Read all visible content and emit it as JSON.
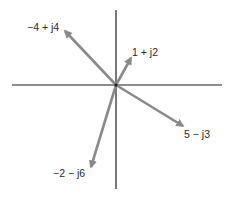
{
  "diagram": {
    "colors": {
      "axis": "#1e1e1e",
      "arrow": "#8a8a8a",
      "text": "#2a2a2a",
      "background": "#ffffff"
    },
    "origin": {
      "x": 116,
      "y": 85
    },
    "axes": {
      "horizontal": {
        "x1": 12,
        "y1": 85,
        "x2": 222,
        "y2": 85
      },
      "vertical": {
        "x1": 116,
        "y1": 10,
        "x2": 116,
        "y2": 189
      }
    },
    "phasors": [
      {
        "label": "−4 + j4",
        "real": -4,
        "imag": 4,
        "tip": {
          "x": 65,
          "y": 31
        },
        "label_pos": {
          "x": 27,
          "y": 21
        }
      },
      {
        "label": "1 + j2",
        "real": 1,
        "imag": 2,
        "tip": {
          "x": 131,
          "y": 58
        },
        "label_pos": {
          "x": 132,
          "y": 46
        }
      },
      {
        "label": "5 − j3",
        "real": 5,
        "imag": -3,
        "tip": {
          "x": 183,
          "y": 126
        },
        "label_pos": {
          "x": 184,
          "y": 128
        }
      },
      {
        "label": "−2 − j6",
        "real": -2,
        "imag": -6,
        "tip": {
          "x": 91,
          "y": 167
        },
        "label_pos": {
          "x": 53,
          "y": 167
        }
      }
    ]
  }
}
